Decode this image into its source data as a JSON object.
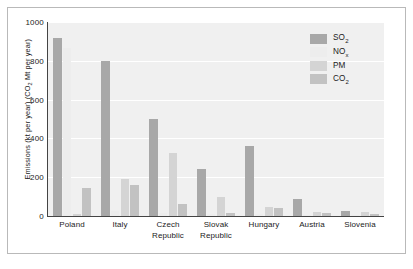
{
  "chart_data": {
    "type": "bar",
    "title": "",
    "subtitle": "",
    "xlabel": "",
    "ylabel": "Emissions (kt per year) (CO2 Mt per year)",
    "ylabel_parts": {
      "pre": "Emissions (kt per year) (CO",
      "sub": "2",
      "post": " Mt per year)"
    },
    "ylim": [
      0,
      1000
    ],
    "yticks": [
      0,
      200,
      400,
      600,
      800,
      1000
    ],
    "ytick_labels": [
      "0",
      "200",
      "400",
      "600",
      "800",
      "1000"
    ],
    "grid": "horizontal",
    "legend_position": "top-right",
    "categories": [
      "Poland",
      "Italy",
      "Czech Republic",
      "Slovak Republic",
      "Hungary",
      "Austria",
      "Slovenia"
    ],
    "category_lines": [
      [
        "Poland"
      ],
      [
        "Italy"
      ],
      [
        "Czech",
        "Republic"
      ],
      [
        "Slovak",
        "Republic"
      ],
      [
        "Hungary"
      ],
      [
        "Austria"
      ],
      [
        "Slovenia"
      ]
    ],
    "series": [
      {
        "name": "SO2",
        "label_parts": {
          "pre": "SO",
          "sub": "2",
          "post": ""
        },
        "color": "#a8a8a8",
        "values": [
          920,
          800,
          500,
          240,
          360,
          90,
          25
        ]
      },
      {
        "name": "NOx",
        "label_parts": {
          "pre": "NO",
          "sub": "x",
          "post": ""
        },
        "color": "#ededed",
        "values": [
          865,
          25,
          15,
          10,
          8,
          5,
          3
        ]
      },
      {
        "name": "PM",
        "label_parts": {
          "pre": "PM",
          "sub": "",
          "post": ""
        },
        "color": "#d4d4d4",
        "values": [
          10,
          190,
          325,
          100,
          45,
          22,
          22
        ]
      },
      {
        "name": "CO2",
        "label_parts": {
          "pre": "CO",
          "sub": "2",
          "post": ""
        },
        "color": "#c2c2c2",
        "values": [
          145,
          160,
          60,
          15,
          40,
          18,
          12
        ]
      }
    ]
  },
  "colors": {
    "plot_background": "#f0f0f0",
    "gridline": "#ffffff",
    "axis": "#444444",
    "frame": "#b9b9b9",
    "text": "#1b1b1b"
  }
}
